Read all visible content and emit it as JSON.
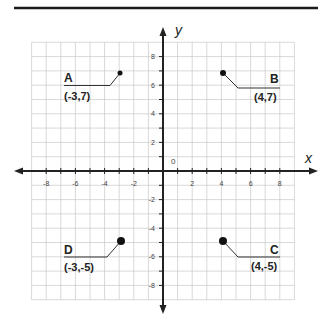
{
  "diagram": {
    "type": "coordinate-plane",
    "axes": {
      "x_label": "x",
      "y_label": "y",
      "origin_label": "0",
      "x_ticks": [
        "-8",
        "-6",
        "-4",
        "-2",
        "2",
        "4",
        "6",
        "8"
      ],
      "y_ticks": [
        "8",
        "6",
        "4",
        "2",
        "-2",
        "-4",
        "-6",
        "-8"
      ],
      "range": [
        -9,
        9
      ]
    },
    "points": [
      {
        "name": "A",
        "coord": "(-3,7)",
        "x": -3,
        "y": 7
      },
      {
        "name": "B",
        "coord": "(4,7)",
        "x": 4,
        "y": 7
      },
      {
        "name": "C",
        "coord": "(4,-5)",
        "x": 4,
        "y": -5
      },
      {
        "name": "D",
        "coord": "(-3,-5)",
        "x": -3,
        "y": -5
      }
    ],
    "colors": {
      "grid": "#c8c8c8",
      "axis": "#222222",
      "top_rule": "#1a1a1a",
      "point": "#111111"
    }
  }
}
